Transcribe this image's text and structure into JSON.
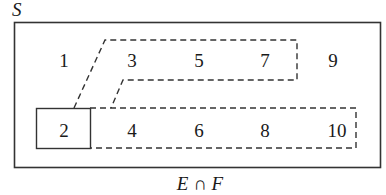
{
  "diagram": {
    "universe_label": "S",
    "caption": "E ∩ F",
    "numbers": {
      "n1": "1",
      "n2": "2",
      "n3": "3",
      "n4": "4",
      "n5": "5",
      "n6": "6",
      "n7": "7",
      "n8": "8",
      "n9": "9",
      "n10": "10"
    },
    "sets": {
      "upper_dashed": [
        "3",
        "5",
        "7"
      ],
      "lower_dashed": [
        "2",
        "4",
        "6",
        "8",
        "10"
      ],
      "solid_box": [
        "2"
      ]
    },
    "colors": {
      "line": "#333333",
      "text": "#1a1a1a",
      "background": "#ffffff"
    }
  }
}
